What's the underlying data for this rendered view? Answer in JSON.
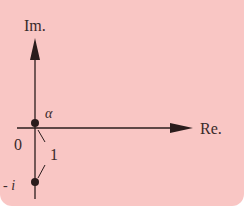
{
  "diagram": {
    "axes": {
      "x_label": "Re.",
      "y_label": "Im."
    },
    "points": [
      {
        "name": "alpha",
        "label": "α"
      },
      {
        "name": "minus-i",
        "label": "- i"
      }
    ],
    "origin_label": "0",
    "distance_label": "1",
    "colors": {
      "background": "#f9c6c4",
      "ink": "#2a1c1c"
    }
  }
}
